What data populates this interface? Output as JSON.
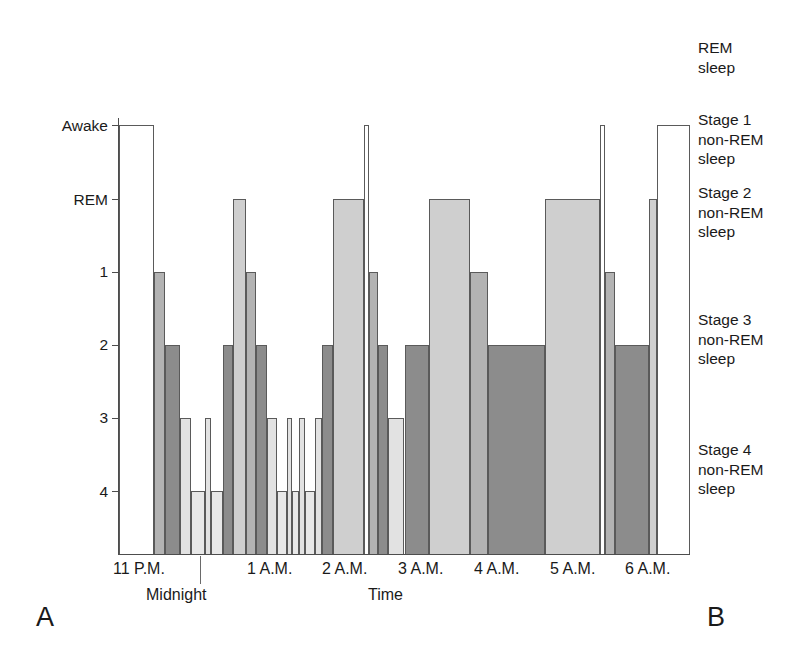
{
  "figure": {
    "panel_a_letter": "A",
    "panel_b_letter": "B",
    "x_axis_title": "Time",
    "midnight_label": "Midnight"
  },
  "y_axis": {
    "ticks": [
      {
        "label": "Awake",
        "stage": "awake"
      },
      {
        "label": "REM",
        "stage": "rem"
      },
      {
        "label": "1",
        "stage": "s1"
      },
      {
        "label": "2",
        "stage": "s2"
      },
      {
        "label": "3",
        "stage": "s3"
      },
      {
        "label": "4",
        "stage": "s4"
      }
    ]
  },
  "x_axis": {
    "ticks": [
      {
        "label": "11 P.M."
      },
      {
        "label": "1 A.M."
      },
      {
        "label": "2 A.M."
      },
      {
        "label": "3 A.M."
      },
      {
        "label": "4 A.M."
      },
      {
        "label": "5 A.M."
      },
      {
        "label": "6 A.M."
      }
    ]
  },
  "legend": {
    "entries": [
      {
        "lines": "REM sleep",
        "line1": "REM",
        "line2": "sleep",
        "line3": ""
      },
      {
        "lines": "Stage 1 non-REM sleep",
        "line1": "Stage 1",
        "line2": "non-REM",
        "line3": "sleep"
      },
      {
        "lines": "Stage 2 non-REM sleep",
        "line1": "Stage 2",
        "line2": "non-REM",
        "line3": "sleep"
      },
      {
        "lines": "Stage 3 non-REM sleep",
        "line1": "Stage 3",
        "line2": "non-REM",
        "line3": "sleep"
      },
      {
        "lines": "Stage 4 non-REM sleep",
        "line1": "Stage 4",
        "line2": "non-REM",
        "line3": "sleep"
      }
    ]
  },
  "colors": {
    "awake": "#ffffff",
    "rem": "#cfcfcf",
    "stage1": "#b3b3b3",
    "stage2": "#8c8c8c",
    "stage3": "#e2e2e2",
    "stage4": "#e8e8e8",
    "outline": "#5a5a5a",
    "axis": "#4d4d4d",
    "text": "#1a1a1a"
  },
  "chart_data": {
    "type": "bar",
    "title": "",
    "subtitle": "",
    "xlabel": "Time",
    "ylabel": "",
    "grid": false,
    "legend_position": "right",
    "note": "Hypnogram: sleep stage across the night. Bar height encodes stage; higher bar = lighter sleep. Stage order from top: Awake, REM, 1, 2, 3, 4.",
    "y_categories": [
      "Awake",
      "REM",
      "1",
      "2",
      "3",
      "4"
    ],
    "x_tick_labels": [
      "11 P.M.",
      "Midnight",
      "1 A.M.",
      "2 A.M.",
      "3 A.M.",
      "4 A.M.",
      "5 A.M.",
      "6 A.M."
    ],
    "x_range_hours": [
      23.0,
      30.0
    ],
    "segments": [
      {
        "stage": "awake",
        "start": 23.0,
        "end": 23.43
      },
      {
        "stage": "s1",
        "start": 23.43,
        "end": 23.56
      },
      {
        "stage": "s2",
        "start": 23.56,
        "end": 23.75
      },
      {
        "stage": "s3",
        "start": 23.75,
        "end": 23.88
      },
      {
        "stage": "s4",
        "start": 23.88,
        "end": 24.06
      },
      {
        "stage": "s3",
        "start": 24.06,
        "end": 24.13
      },
      {
        "stage": "s4",
        "start": 24.13,
        "end": 24.28
      },
      {
        "stage": "s2",
        "start": 24.28,
        "end": 24.4
      },
      {
        "stage": "rem",
        "start": 24.4,
        "end": 24.56
      },
      {
        "stage": "s1",
        "start": 24.56,
        "end": 24.68
      },
      {
        "stage": "s2",
        "start": 24.68,
        "end": 24.81
      },
      {
        "stage": "s3",
        "start": 24.81,
        "end": 24.94
      },
      {
        "stage": "s4",
        "start": 24.94,
        "end": 25.06
      },
      {
        "stage": "s3",
        "start": 25.06,
        "end": 25.12
      },
      {
        "stage": "s4",
        "start": 25.12,
        "end": 25.21
      },
      {
        "stage": "s3",
        "start": 25.21,
        "end": 25.28
      },
      {
        "stage": "s4",
        "start": 25.28,
        "end": 25.4
      },
      {
        "stage": "s3",
        "start": 25.4,
        "end": 25.49
      },
      {
        "stage": "s2",
        "start": 25.49,
        "end": 25.62
      },
      {
        "stage": "rem",
        "start": 25.62,
        "end": 26.0
      },
      {
        "stage": "awake",
        "start": 26.0,
        "end": 26.06
      },
      {
        "stage": "s1",
        "start": 26.06,
        "end": 26.18
      },
      {
        "stage": "s2",
        "start": 26.18,
        "end": 26.3
      },
      {
        "stage": "s3",
        "start": 26.3,
        "end": 26.5
      },
      {
        "stage": "s2",
        "start": 26.5,
        "end": 26.8
      },
      {
        "stage": "rem",
        "start": 26.8,
        "end": 27.3
      },
      {
        "stage": "s1",
        "start": 27.3,
        "end": 27.52
      },
      {
        "stage": "s2",
        "start": 27.52,
        "end": 28.22
      },
      {
        "stage": "rem",
        "start": 28.22,
        "end": 28.9
      },
      {
        "stage": "awake",
        "start": 28.9,
        "end": 28.96
      },
      {
        "stage": "s1",
        "start": 28.96,
        "end": 29.08
      },
      {
        "stage": "s2",
        "start": 29.08,
        "end": 29.5
      },
      {
        "stage": "rem",
        "start": 29.5,
        "end": 29.6
      },
      {
        "stage": "awake",
        "start": 29.6,
        "end": 30.0
      }
    ]
  }
}
